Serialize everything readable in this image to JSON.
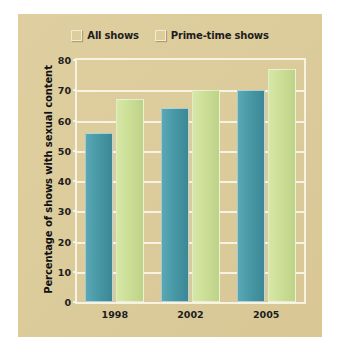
{
  "chart_data": {
    "type": "bar",
    "title": "",
    "xlabel": "",
    "ylabel": "Percentage of shows with sexual content",
    "categories": [
      "1998",
      "2002",
      "2005"
    ],
    "series": [
      {
        "name": "All shows",
        "color": "#4a9aa8",
        "values": [
          56,
          64,
          70
        ]
      },
      {
        "name": "Prime-time shows",
        "color": "#cde098",
        "values": [
          67,
          70,
          77
        ]
      }
    ],
    "ylim": [
      0,
      80
    ],
    "ytick_labels": [
      "0",
      "10",
      "20",
      "30",
      "40",
      "50",
      "60",
      "70",
      "80"
    ],
    "ytick_values": [
      0,
      10,
      20,
      30,
      40,
      50,
      60,
      70,
      80
    ],
    "grid": true,
    "legend_position": "top-center",
    "background_color": "#ddcc9a",
    "gridline_color": "#f7f2e2"
  }
}
